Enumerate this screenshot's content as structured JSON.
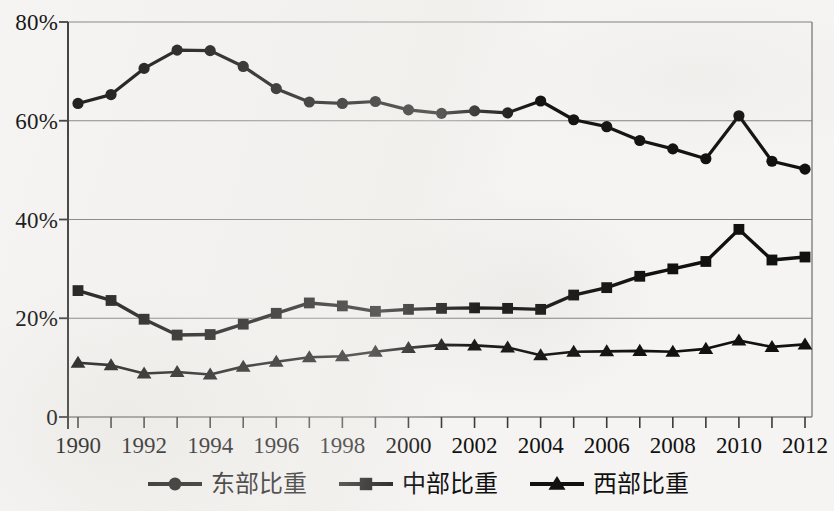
{
  "chart_data": {
    "type": "line",
    "title": "",
    "xlabel": "",
    "ylabel": "",
    "xlim": [
      1990,
      2012
    ],
    "ylim": [
      0,
      80
    ],
    "grid": true,
    "legend_position": "bottom-center",
    "y_ticks": [
      "0",
      "20%",
      "40%",
      "60%",
      "80%"
    ],
    "y_tick_values": [
      0,
      20,
      40,
      60,
      80
    ],
    "x_ticks": [
      "1990",
      "1992",
      "1994",
      "1996",
      "1998",
      "2000",
      "2002",
      "2004",
      "2006",
      "2008",
      "2010",
      "2012"
    ],
    "x": [
      1990,
      1991,
      1992,
      1993,
      1994,
      1995,
      1996,
      1997,
      1998,
      1999,
      2000,
      2001,
      2002,
      2003,
      2004,
      2005,
      2006,
      2007,
      2008,
      2009,
      2010,
      2011,
      2012
    ],
    "series": [
      {
        "name": "东部比重",
        "marker": "circle",
        "values": [
          63.5,
          65.3,
          70.6,
          74.3,
          74.2,
          71.0,
          66.5,
          63.8,
          63.5,
          63.9,
          62.2,
          61.5,
          62.0,
          61.6,
          64.0,
          60.2,
          58.8,
          56.0,
          54.3,
          52.3,
          61.0,
          51.8,
          50.2
        ]
      },
      {
        "name": "中部比重",
        "marker": "square",
        "values": [
          25.6,
          23.6,
          19.8,
          16.6,
          16.7,
          18.8,
          21.0,
          23.1,
          22.5,
          21.4,
          21.8,
          22.0,
          22.1,
          22.0,
          21.8,
          24.7,
          26.2,
          28.5,
          30.0,
          31.5,
          38.0,
          31.8,
          32.4
        ]
      },
      {
        "name": "西部比重",
        "marker": "triangle",
        "values": [
          11.0,
          10.5,
          8.8,
          9.1,
          8.6,
          10.2,
          11.2,
          12.1,
          12.3,
          13.2,
          14.0,
          14.6,
          14.5,
          14.1,
          12.5,
          13.2,
          13.3,
          13.4,
          13.2,
          13.8,
          15.5,
          14.2,
          14.7
        ]
      }
    ]
  },
  "legend": {
    "entries": [
      {
        "label": "东部比重",
        "marker": "circle-marker-icon"
      },
      {
        "label": "中部比重",
        "marker": "square-marker-icon"
      },
      {
        "label": "西部比重",
        "marker": "triangle-marker-icon"
      }
    ]
  },
  "colors": {
    "series": "#111111",
    "grid": "#808080",
    "axis": "#3a3a3a",
    "background": "#f5f4f2"
  }
}
